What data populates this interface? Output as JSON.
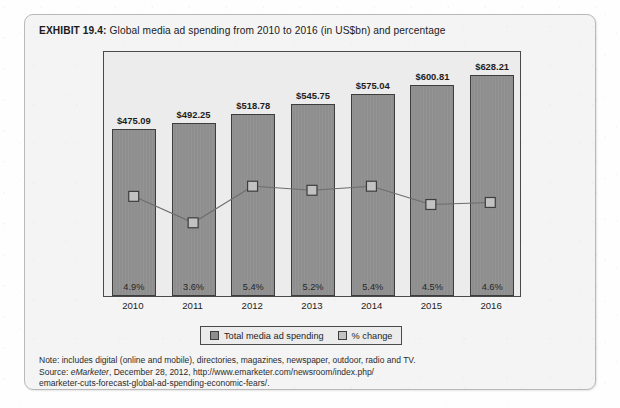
{
  "exhibit": {
    "label": "EXHIBIT 19.4:",
    "caption": "Global media ad spending from 2010 to 2016 (in US$bn) and percentage"
  },
  "legend": {
    "items": [
      {
        "name": "total-media-ad-spending",
        "label": "Total media ad spending",
        "color": "#8e8e8e"
      },
      {
        "name": "percent-change",
        "label": "% change",
        "color": "#c2c2c2"
      }
    ]
  },
  "footnotes": {
    "note": "Note: includes digital (online and mobile), directories, magazines, newspaper, outdoor, radio and TV.",
    "source_prefix": "Source: ",
    "source_italic": "eMarketer",
    "source_rest": ", December 28, 2012, http://www.emarketer.com/newsroom/index.php/",
    "source_line3": "emarketer-cuts-forecast-global-ad-spending-economic-fears/."
  },
  "chart_data": {
    "type": "bar",
    "title": "Global media ad spending from 2010 to 2016 (in US$bn) and percentage",
    "xlabel": "",
    "ylabel": "",
    "grid": false,
    "legend_position": "bottom",
    "categories": [
      "2010",
      "2011",
      "2012",
      "2013",
      "2014",
      "2015",
      "2016"
    ],
    "series": [
      {
        "name": "Total media ad spending",
        "type": "bar",
        "unit": "US$bn",
        "values": [
          475.09,
          492.25,
          518.78,
          545.75,
          575.04,
          600.81,
          628.21
        ],
        "labels": [
          "$475.09",
          "$492.25",
          "$518.78",
          "$545.75",
          "$575.04",
          "$600.81",
          "$628.21"
        ],
        "color": "#8e8e8e",
        "ylim": [
          0,
          700
        ]
      },
      {
        "name": "% change",
        "type": "line",
        "unit": "%",
        "values": [
          4.9,
          3.6,
          5.4,
          5.2,
          5.4,
          4.5,
          4.6
        ],
        "labels": [
          "4.9%",
          "3.6%",
          "5.4%",
          "5.2%",
          "5.4%",
          "4.5%",
          "4.6%"
        ],
        "color": "#c2c2c2",
        "marker": "square",
        "ylim": [
          0,
          12
        ]
      }
    ]
  }
}
